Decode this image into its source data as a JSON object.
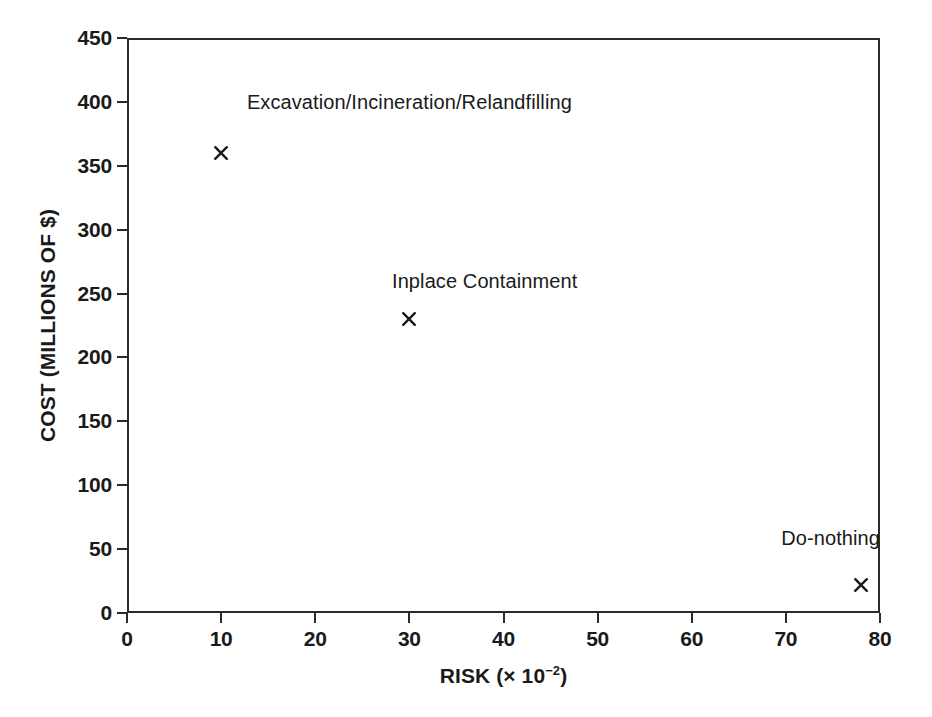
{
  "chart_data": {
    "type": "scatter",
    "title": "",
    "xlabel": "RISK (× 10⁻²)",
    "xlabel_prefix": "RISK (× 10",
    "xlabel_exponent": "−2",
    "xlabel_suffix": ")",
    "ylabel": "COST (MILLIONS OF $)",
    "xlim": [
      0,
      80
    ],
    "ylim": [
      0,
      450
    ],
    "xticks": [
      "0",
      "10",
      "20",
      "30",
      "40",
      "50",
      "60",
      "70",
      "80"
    ],
    "xtick_values": [
      0,
      10,
      20,
      30,
      40,
      50,
      60,
      70,
      80
    ],
    "yticks": [
      "0",
      "50",
      "100",
      "150",
      "200",
      "250",
      "300",
      "350",
      "400",
      "450"
    ],
    "ytick_values": [
      0,
      50,
      100,
      150,
      200,
      250,
      300,
      350,
      400,
      450
    ],
    "grid": false,
    "legend": "none",
    "marker_symbol": "x",
    "marker_color": "#1a1a1a",
    "points": [
      {
        "label": "Excavation/Incineration/Relandfilling",
        "x": 10,
        "y": 360,
        "label_x": 30,
        "label_y": 398,
        "label_anchor": "center"
      },
      {
        "label": "Inplace Containment",
        "x": 30,
        "y": 230,
        "label_x": 38,
        "label_y": 258,
        "label_anchor": "center"
      },
      {
        "label": "Do-nothing",
        "x": 78,
        "y": 22,
        "label_x": 80,
        "label_y": 57,
        "label_anchor": "right"
      }
    ]
  }
}
